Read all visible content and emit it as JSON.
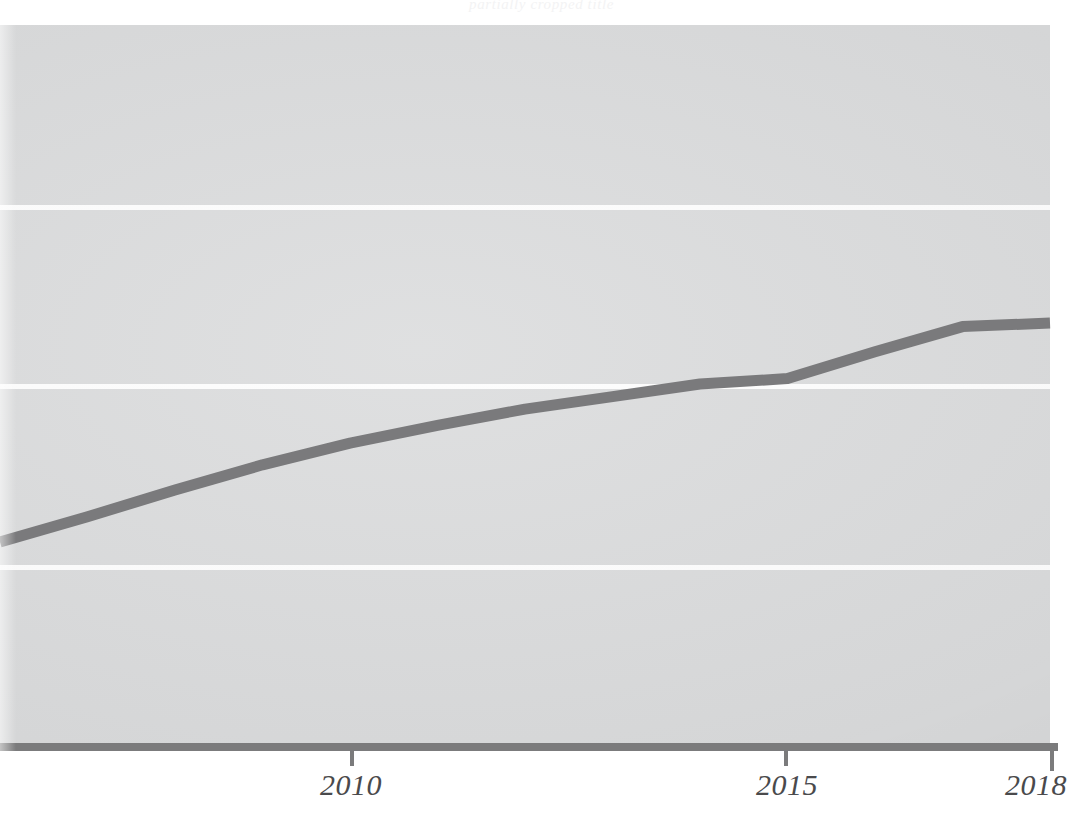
{
  "figure": {
    "width": 1083,
    "height": 821,
    "background_color": "#ffffff",
    "panel_color": "#d9dadb",
    "gridline_color": "#fdfdfd",
    "axis_color": "#7b7b7c",
    "series_color": "#7a7a7c",
    "title_fragment": "partially cropped title"
  },
  "chart_data": {
    "type": "line",
    "title": "",
    "subtitle": "",
    "xlabel": "",
    "ylabel": "",
    "grid": true,
    "legend": false,
    "legend_position": "none",
    "xlim": [
      2006,
      2018
    ],
    "ylim": [
      0,
      4
    ],
    "x_ticks": [
      2010,
      2015,
      2018
    ],
    "x_tick_labels": [
      "2010",
      "2015",
      "2018"
    ],
    "y_ticks": [
      1,
      2,
      3
    ],
    "y_tick_labels": [
      "",
      "",
      ""
    ],
    "series": [
      {
        "name": "series-1",
        "color": "#7a7a7c",
        "line_width": 11,
        "x": [
          2006,
          2007,
          2008,
          2009,
          2010,
          2011,
          2012,
          2013,
          2014,
          2015,
          2016,
          2017,
          2018
        ],
        "values": [
          1.12,
          1.26,
          1.41,
          1.55,
          1.67,
          1.77,
          1.86,
          1.93,
          2.0,
          2.03,
          2.18,
          2.32,
          2.34
        ]
      }
    ]
  },
  "axis": {
    "ticks": [
      {
        "label": "2010",
        "x": 352
      },
      {
        "label": "2015",
        "x": 786
      },
      {
        "label": "2018",
        "x": 1050
      }
    ]
  },
  "gridlines": {
    "y_positions": [
      205,
      384,
      565
    ]
  }
}
